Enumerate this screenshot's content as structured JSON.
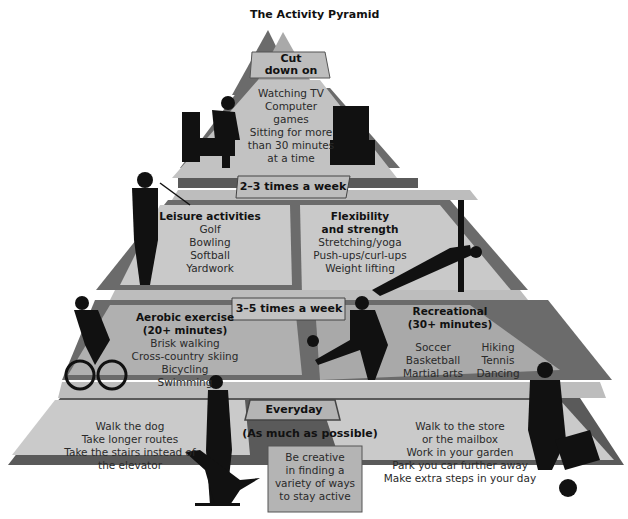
{
  "title": "The Activity Pyramid",
  "colors": {
    "tier_light": "#c9c9c9",
    "tier_mid": "#a9a9a9",
    "tier_dark": "#6b6b6b",
    "band_dark": "#5a5a5a",
    "label_box": "#bdbdbd",
    "silhouette": "#111111"
  },
  "tiers": {
    "top": {
      "header": [
        "Cut",
        "down on"
      ],
      "items": [
        "Watching TV",
        "Computer",
        "games",
        "Sitting for more",
        "than 30 minutes",
        "at a time"
      ],
      "icons": [
        "person-in-armchair-icon",
        "television-icon"
      ]
    },
    "second": {
      "frequency": "2–3 times a week",
      "left": {
        "heading": "Leisure activities",
        "items": [
          "Golf",
          "Bowling",
          "Softball",
          "Yardwork"
        ],
        "icon": "golfer-icon"
      },
      "right": {
        "heading": [
          "Flexibility",
          "and strength"
        ],
        "items": [
          "Stretching/yoga",
          "Push-ups/curl-ups",
          "Weight lifting"
        ],
        "icon": "yoga-side-plank-icon"
      }
    },
    "third": {
      "frequency": "3–5 times a week",
      "left": {
        "heading": [
          "Aerobic exercise",
          "(20+ minutes)"
        ],
        "items": [
          "Brisk walking",
          "Cross-country skiing",
          "Bicycling",
          "Swimming"
        ],
        "icon": "cyclist-icon"
      },
      "right": {
        "heading": [
          "Recreational",
          "(30+ minutes)"
        ],
        "items_col1": [
          "Soccer",
          "Basketball",
          "Martial arts"
        ],
        "items_col2": [
          "Hiking",
          "Tennis",
          "Dancing"
        ],
        "icon": "soccer-player-icon"
      }
    },
    "base": {
      "frequency": "Everyday",
      "subtitle": "(As much as possible)",
      "left_items": [
        "Walk the dog",
        "Take longer routes",
        "Take the stairs instead of",
        "the elevator"
      ],
      "center_box": [
        "Be creative",
        "in finding a",
        "variety of ways",
        "to stay active"
      ],
      "right_items": [
        "Walk to the store",
        "or the mailbox",
        "Work in your garden",
        "Park you car further away",
        "Make extra steps in your day"
      ],
      "icons": [
        "person-walking-dog-icon",
        "person-with-wheelbarrow-icon"
      ]
    }
  }
}
